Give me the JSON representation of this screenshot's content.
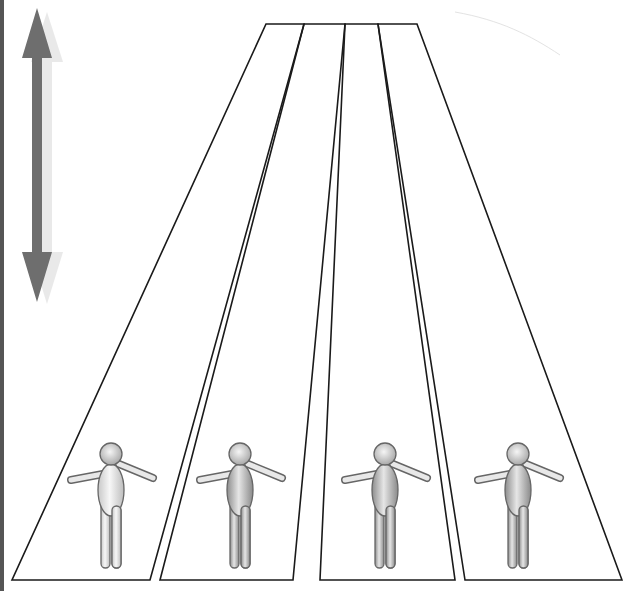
{
  "diagram": {
    "colors": {
      "background": "#ffffff",
      "lane_stroke": "#1a1a1a",
      "arrow": "#6e6e6e",
      "arrow_shadow": "#cfcfcf",
      "figure_fill_light": "#f2f2f2",
      "figure_fill_dark": "#9a9a9a",
      "figure_stroke": "#666666"
    },
    "arrow": {
      "icon": "double-headed-vertical-arrow",
      "x": 37,
      "y_top": 8,
      "y_bottom": 302
    },
    "lanes": [
      {
        "name": "lane-1",
        "points": "266,24 304,24 150,580 12,580"
      },
      {
        "name": "lane-2",
        "points": "304,24 345,24 293,580 160,580"
      },
      {
        "name": "lane-3",
        "points": "345,24 378,24 455,580 320,580"
      },
      {
        "name": "lane-4",
        "points": "378,24 417,24 622,580 465,580"
      }
    ],
    "figures": [
      {
        "name": "figure-1",
        "cx": 111,
        "shade": "light"
      },
      {
        "name": "figure-2",
        "cx": 240,
        "shade": "dark"
      },
      {
        "name": "figure-3",
        "cx": 385,
        "shade": "dark"
      },
      {
        "name": "figure-4",
        "cx": 518,
        "shade": "dark"
      }
    ]
  }
}
